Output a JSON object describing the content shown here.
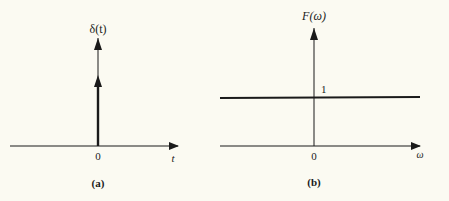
{
  "panel_a": {
    "y_label": "δ(t)",
    "x_label": "t",
    "origin_label": "0",
    "caption": "(a)"
  },
  "panel_b": {
    "y_label": "F(ω)",
    "x_label": "ω",
    "origin_label": "0",
    "level_label": "1",
    "caption": "(b)"
  },
  "colors": {
    "ink": "#1a1a1a",
    "background": "#fbfaf2"
  }
}
